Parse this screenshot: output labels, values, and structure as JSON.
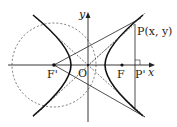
{
  "diagram": {
    "type": "hyperbola-geometry",
    "axes": {
      "x_label": "x",
      "y_label": "y"
    },
    "points": {
      "origin": "O",
      "focus_left": "F'",
      "focus_right": "F",
      "point_on_curve": "P(x, y)",
      "foot": "P'"
    },
    "colors": {
      "stroke": "#222222",
      "dashed": "#555555",
      "background": "#ffffff"
    }
  }
}
